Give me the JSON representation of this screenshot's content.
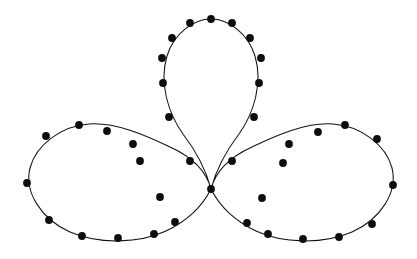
{
  "figure": {
    "type": "parametric-curve-plot",
    "width": 417,
    "height": 259,
    "background_color": "#ffffff",
    "curve_color": "#111111",
    "marker_color": "#0d0d0d",
    "curve_stroke_width": 1.05,
    "marker_radius": 3.9,
    "marker_count": 36,
    "lobe_count": 3,
    "center_node": {
      "x": 211,
      "y": 189
    },
    "extremes": {
      "top_apex": {
        "x": 211,
        "y": 19
      },
      "leftmost": {
        "x": 27,
        "y": 183
      },
      "rightmost": {
        "x": 393,
        "y": 185
      },
      "bottom_left": {
        "x": 118,
        "y": 238
      },
      "bottom_right": {
        "x": 303,
        "y": 239
      }
    }
  },
  "chart_data": {
    "type": "scatter",
    "subtitle": "",
    "xlabel": "",
    "ylabel": "",
    "xlim": [
      0,
      417
    ],
    "ylim": [
      259,
      0
    ],
    "grid": false,
    "axes_visible": false,
    "tick_labels_x": [],
    "tick_labels_y": [],
    "legend": [],
    "legend_position": "none",
    "annotations": [],
    "series": [
      {
        "name": "trefoil-curve",
        "kind": "closed-parametric-curve",
        "stroke": "#111111",
        "description": "Three-lobed closed curve (rose-like trefoil) crossing itself at a single central node",
        "path": "M 211 189 C 206 170 196 151 183 134 C 168 113 159 83 167 56 C 174 33 194 19 211 19 C 228 19 248 33 255 56 C 263 83 254 113 239 134 C 226 151 216 170 211 189 C 216 170 232 156 252 147 C 277 135 307 122 333 124 C 361 126 386 145 392 168 C 398 192 381 219 352 232 C 322 245 282 243 256 231 C 233 220 219 205 211 189 C 203 205 189 220 166 231 C 140 243 100 245 70 232 C 41 219 24 192 30 168 C 36 145 61 126 89 124 C 115 122 145 135 170 147 C 190 156 206 170 211 189 Z"
      },
      {
        "name": "sample-markers",
        "kind": "markers",
        "marker": "filled-circle",
        "marker_color": "#0d0d0d",
        "marker_radius": 3.9,
        "count": 36,
        "points": [
          {
            "x": 211,
            "y": 19
          },
          {
            "x": 190,
            "y": 23
          },
          {
            "x": 172,
            "y": 38
          },
          {
            "x": 162,
            "y": 58
          },
          {
            "x": 163,
            "y": 83
          },
          {
            "x": 169,
            "y": 117
          },
          {
            "x": 190,
            "y": 161
          },
          {
            "x": 211,
            "y": 189
          },
          {
            "x": 232,
            "y": 161
          },
          {
            "x": 254,
            "y": 117
          },
          {
            "x": 259,
            "y": 83
          },
          {
            "x": 261,
            "y": 58
          },
          {
            "x": 250,
            "y": 38
          },
          {
            "x": 232,
            "y": 23
          },
          {
            "x": 283,
            "y": 163
          },
          {
            "x": 262,
            "y": 198
          },
          {
            "x": 247,
            "y": 223
          },
          {
            "x": 268,
            "y": 234
          },
          {
            "x": 303,
            "y": 239
          },
          {
            "x": 339,
            "y": 237
          },
          {
            "x": 372,
            "y": 224
          },
          {
            "x": 393,
            "y": 185
          },
          {
            "x": 377,
            "y": 139
          },
          {
            "x": 345,
            "y": 125
          },
          {
            "x": 318,
            "y": 132
          },
          {
            "x": 289,
            "y": 144
          },
          {
            "x": 140,
            "y": 161
          },
          {
            "x": 160,
            "y": 197
          },
          {
            "x": 175,
            "y": 222
          },
          {
            "x": 154,
            "y": 234
          },
          {
            "x": 118,
            "y": 238
          },
          {
            "x": 82,
            "y": 236
          },
          {
            "x": 49,
            "y": 220
          },
          {
            "x": 27,
            "y": 183
          },
          {
            "x": 46,
            "y": 136
          },
          {
            "x": 79,
            "y": 125
          },
          {
            "x": 107,
            "y": 131
          },
          {
            "x": 133,
            "y": 144
          }
        ]
      }
    ]
  }
}
